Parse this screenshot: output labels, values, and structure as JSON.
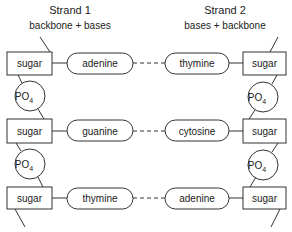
{
  "strand1": {
    "title": "Strand 1",
    "subtitle": "backbone + bases"
  },
  "strand2": {
    "title": "Strand 2",
    "subtitle": "bases + backbone"
  },
  "rows": [
    {
      "left_sugar": "sugar",
      "left_base": "adenine",
      "right_base": "thymine",
      "right_sugar": "sugar"
    },
    {
      "left_sugar": "sugar",
      "left_base": "guanine",
      "right_base": "cytosine",
      "right_sugar": "sugar"
    },
    {
      "left_sugar": "sugar",
      "left_base": "thymine",
      "right_base": "adenine",
      "right_sugar": "sugar"
    }
  ],
  "phosphate": {
    "main": "PO",
    "sub": "4"
  }
}
